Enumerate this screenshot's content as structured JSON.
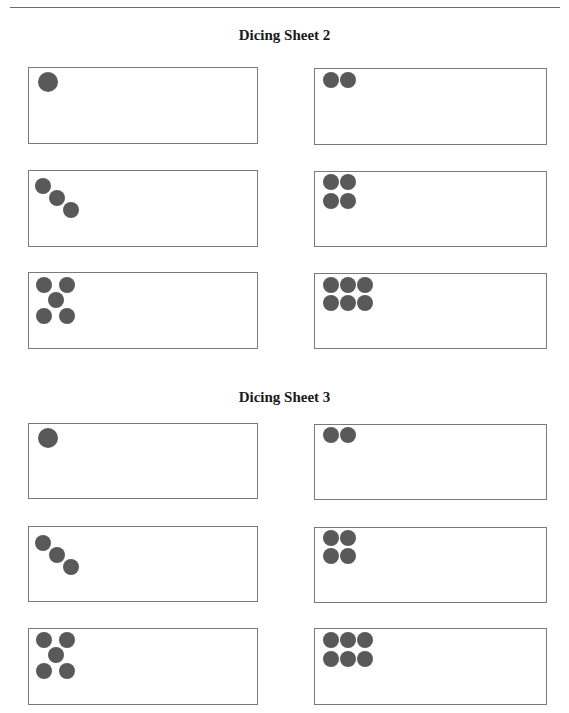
{
  "sheets": [
    {
      "title": "Dicing Sheet 2",
      "title_y": 27,
      "boxes": [
        {
          "face": 1,
          "x": 28,
          "y": 67,
          "w": 230,
          "h": 77,
          "dots": [
            [
              48,
              82,
              10
            ]
          ]
        },
        {
          "face": 2,
          "x": 314,
          "y": 68,
          "w": 233,
          "h": 77,
          "dots": [
            [
              331,
              80,
              8
            ],
            [
              348,
              80,
              8
            ]
          ]
        },
        {
          "face": 3,
          "x": 28,
          "y": 170,
          "w": 230,
          "h": 77,
          "dots": [
            [
              43,
              186,
              8
            ],
            [
              57,
              198,
              8
            ],
            [
              71,
              210,
              8
            ]
          ]
        },
        {
          "face": 4,
          "x": 314,
          "y": 171,
          "w": 233,
          "h": 76,
          "dots": [
            [
              331,
              182,
              8
            ],
            [
              348,
              182,
              8
            ],
            [
              331,
              201,
              8
            ],
            [
              348,
              201,
              8
            ]
          ]
        },
        {
          "face": 5,
          "x": 28,
          "y": 272,
          "w": 230,
          "h": 77,
          "dots": [
            [
              44,
              285,
              8
            ],
            [
              67,
              285,
              8
            ],
            [
              56,
              300,
              8
            ],
            [
              44,
              316,
              8
            ],
            [
              67,
              316,
              8
            ]
          ]
        },
        {
          "face": 6,
          "x": 314,
          "y": 273,
          "w": 233,
          "h": 76,
          "dots": [
            [
              331,
              285,
              8
            ],
            [
              348,
              285,
              8
            ],
            [
              365,
              285,
              8
            ],
            [
              331,
              303,
              8
            ],
            [
              348,
              303,
              8
            ],
            [
              365,
              303,
              8
            ]
          ]
        }
      ]
    },
    {
      "title": "Dicing Sheet 3",
      "title_y": 389,
      "boxes": [
        {
          "face": 1,
          "x": 28,
          "y": 423,
          "w": 230,
          "h": 76,
          "dots": [
            [
              48,
              438,
              10
            ]
          ]
        },
        {
          "face": 2,
          "x": 314,
          "y": 424,
          "w": 233,
          "h": 76,
          "dots": [
            [
              331,
              435,
              8
            ],
            [
              348,
              435,
              8
            ]
          ]
        },
        {
          "face": 3,
          "x": 28,
          "y": 526,
          "w": 230,
          "h": 76,
          "dots": [
            [
              43,
              543,
              8
            ],
            [
              57,
              555,
              8
            ],
            [
              71,
              567,
              8
            ]
          ]
        },
        {
          "face": 4,
          "x": 314,
          "y": 527,
          "w": 233,
          "h": 76,
          "dots": [
            [
              331,
              538,
              8
            ],
            [
              348,
              538,
              8
            ],
            [
              331,
              556,
              8
            ],
            [
              348,
              556,
              8
            ]
          ]
        },
        {
          "face": 5,
          "x": 28,
          "y": 628,
          "w": 230,
          "h": 77,
          "dots": [
            [
              44,
              640,
              8
            ],
            [
              67,
              640,
              8
            ],
            [
              56,
              655,
              8
            ],
            [
              44,
              671,
              8
            ],
            [
              67,
              671,
              8
            ]
          ]
        },
        {
          "face": 6,
          "x": 314,
          "y": 628,
          "w": 233,
          "h": 77,
          "dots": [
            [
              331,
              640,
              8
            ],
            [
              348,
              640,
              8
            ],
            [
              365,
              640,
              8
            ],
            [
              331,
              659,
              8
            ],
            [
              348,
              659,
              8
            ],
            [
              365,
              659,
              8
            ]
          ]
        }
      ]
    }
  ],
  "colors": {
    "dot": "#595959",
    "border": "#7a7a7a",
    "rule": "#6b6b6b"
  }
}
